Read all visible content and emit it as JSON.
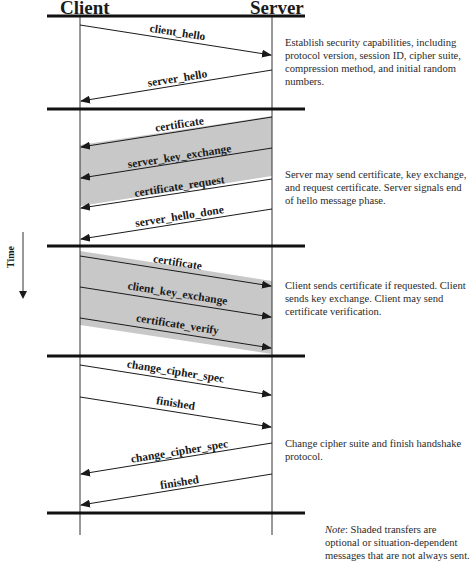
{
  "headers": {
    "client": "Client",
    "server": "Server"
  },
  "time_axis": {
    "label": "Time"
  },
  "phases": [
    {
      "description": "Establish security capabilities, including protocol version, session ID, cipher suite, compression method, and initial random numbers.",
      "messages": [
        {
          "label": "client_hello",
          "direction": "client-to-server",
          "optional": false
        },
        {
          "label": "server_hello",
          "direction": "server-to-client",
          "optional": false
        }
      ]
    },
    {
      "description": "Server may send certificate, key exchange, and request certificate. Server signals end of hello message phase.",
      "messages": [
        {
          "label": "certificate",
          "direction": "server-to-client",
          "optional": true
        },
        {
          "label": "server_key_exchange",
          "direction": "server-to-client",
          "optional": true
        },
        {
          "label": "certificate_request",
          "direction": "server-to-client",
          "optional": true
        },
        {
          "label": "server_hello_done",
          "direction": "server-to-client",
          "optional": false
        }
      ]
    },
    {
      "description": "Client sends certificate if requested. Client sends key exchange. Client may send certificate verification.",
      "messages": [
        {
          "label": "certificate",
          "direction": "client-to-server",
          "optional": true
        },
        {
          "label": "client_key_exchange",
          "direction": "client-to-server",
          "optional": true
        },
        {
          "label": "certificate_verify",
          "direction": "client-to-server",
          "optional": true
        }
      ]
    },
    {
      "description": "Change cipher suite and finish handshake protocol.",
      "messages": [
        {
          "label": "change_cipher_spec",
          "direction": "client-to-server",
          "optional": false
        },
        {
          "label": "finished",
          "direction": "client-to-server",
          "optional": false
        },
        {
          "label": "change_cipher_spec",
          "direction": "server-to-client",
          "optional": false
        },
        {
          "label": "finished",
          "direction": "server-to-client",
          "optional": false
        }
      ]
    }
  ],
  "note": {
    "prefix": "Note",
    "text": ": Shaded transfers are optional or situation-dependent messages that are not always sent."
  },
  "colors": {
    "shading": "#c8c8c8",
    "line": "#1a1a1a"
  }
}
